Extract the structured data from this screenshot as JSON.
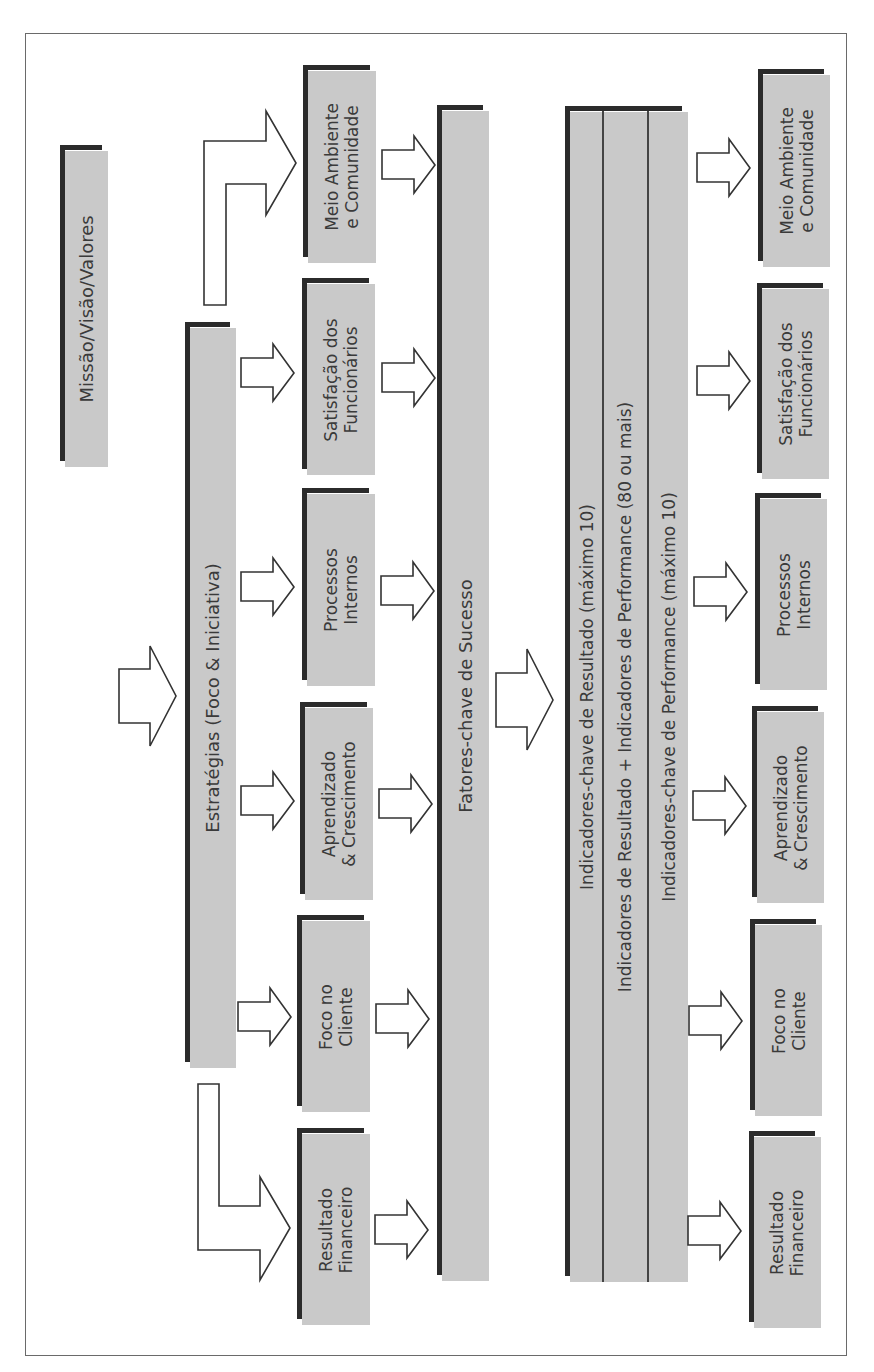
{
  "diagram": {
    "orientation": "rotated-90-ccw",
    "colors": {
      "box_fill": "#c9c9c9",
      "box_shadow": "#2b2b2b",
      "text": "#3a3a3a",
      "frame": "#6a6a6a"
    },
    "mission": {
      "label": "Missão/Visão/Valores"
    },
    "strategies": {
      "label": "Estratégias (Foco & Iniciativa)"
    },
    "perspectives_top": [
      {
        "line1": "Meio Ambiente",
        "line2": "e Comunidade"
      },
      {
        "line1": "Satisfação dos",
        "line2": "Funcionários"
      },
      {
        "line1": "Processos",
        "line2": "Internos"
      },
      {
        "line1": "Aprendizado",
        "line2": "& Crescimento"
      },
      {
        "line1": "Foco no",
        "line2": "Cliente"
      },
      {
        "line1": "Resultado",
        "line2": "Financeiro"
      }
    ],
    "success_factors": {
      "label": "Fatores-chave de Sucesso"
    },
    "indicators": {
      "rows": [
        "Indicadores-chave de Resultado (máximo 10)",
        "Indicadores de Resultado + Indicadores de Performance (80 ou mais)",
        "Indicadores-chave de Performance (máximo 10)"
      ]
    },
    "perspectives_bottom": [
      {
        "line1": "Meio Ambiente",
        "line2": "e Comunidade"
      },
      {
        "line1": "Satisfação dos",
        "line2": "Funcionários"
      },
      {
        "line1": "Processos",
        "line2": "Internos"
      },
      {
        "line1": "Aprendizado",
        "line2": "& Crescimento"
      },
      {
        "line1": "Foco no",
        "line2": "Cliente"
      },
      {
        "line1": "Resultado",
        "line2": "Financeiro"
      }
    ]
  }
}
